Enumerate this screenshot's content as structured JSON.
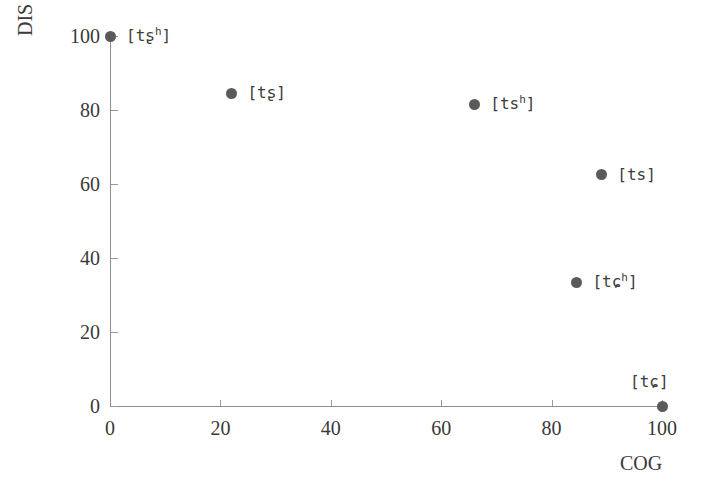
{
  "chart_data": {
    "type": "scatter",
    "title": "",
    "xlabel": "COG",
    "ylabel": "DIS",
    "xlim": [
      0,
      100
    ],
    "ylim": [
      0,
      100
    ],
    "grid": false,
    "legend": "none",
    "xticks": [
      "0",
      "20",
      "40",
      "60",
      "80",
      "100"
    ],
    "xtick_values": [
      0,
      20,
      40,
      60,
      80,
      100
    ],
    "yticks": [
      "0",
      "20",
      "40",
      "60",
      "80",
      "100"
    ],
    "ytick_values": [
      0,
      20,
      40,
      60,
      80,
      100
    ],
    "marker_color": "#5a5a5a",
    "axis_color": "#8d8d8d",
    "points": [
      {
        "label": "[tʂʰ]",
        "base": "[tʂ",
        "sup": "h",
        "close": "]",
        "x": 0,
        "y": 100,
        "label_side": "right"
      },
      {
        "label": "[tʂ]",
        "base": "[tʂ]",
        "sup": "",
        "close": "",
        "x": 22,
        "y": 84.5,
        "label_side": "right"
      },
      {
        "label": "[tsʰ]",
        "base": "[ts",
        "sup": "h",
        "close": "]",
        "x": 66,
        "y": 81.5,
        "label_side": "right"
      },
      {
        "label": "[ts]",
        "base": "[ts]",
        "sup": "",
        "close": "",
        "x": 89,
        "y": 62.5,
        "label_side": "right"
      },
      {
        "label": "[tɕʰ]",
        "base": "[tɕ",
        "sup": "h",
        "close": "]",
        "x": 84.5,
        "y": 33.5,
        "label_side": "right"
      },
      {
        "label": "[tɕ]",
        "base": "[tɕ]",
        "sup": "",
        "close": "",
        "x": 100,
        "y": 0,
        "label_side": "above-left"
      }
    ]
  }
}
